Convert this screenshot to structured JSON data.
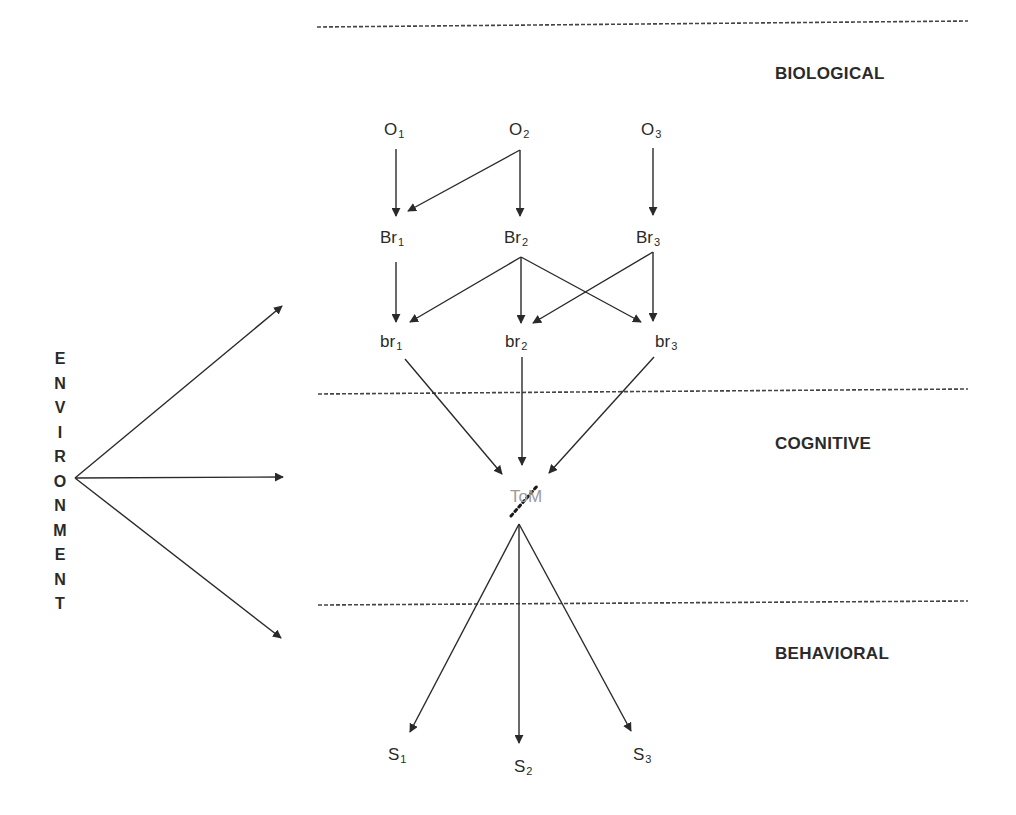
{
  "levels": {
    "biological": "BIOLOGICAL",
    "cognitive": "COGNITIVE",
    "behavioral": "BEHAVIORAL"
  },
  "environment": {
    "label": "ENVIRONMENT",
    "letters": [
      "E",
      "N",
      "V",
      "I",
      "R",
      "O",
      "N",
      "M",
      "E",
      "N",
      "T"
    ]
  },
  "nodes": {
    "O1": {
      "base": "O",
      "sub": "1"
    },
    "O2": {
      "base": "O",
      "sub": "2"
    },
    "O3": {
      "base": "O",
      "sub": "3"
    },
    "Br1": {
      "base": "Br",
      "sub": "1"
    },
    "Br2": {
      "base": "Br",
      "sub": "2"
    },
    "Br3": {
      "base": "Br",
      "sub": "3"
    },
    "br1": {
      "base": "br",
      "sub": "1"
    },
    "br2": {
      "base": "br",
      "sub": "2"
    },
    "br3": {
      "base": "br",
      "sub": "3"
    },
    "ToM": {
      "label": "ToM",
      "color": "#9a9a9a"
    },
    "S1": {
      "base": "S",
      "sub": "1"
    },
    "S2": {
      "base": "S",
      "sub": "2"
    },
    "S3": {
      "base": "S",
      "sub": "3"
    }
  },
  "edges": [
    [
      "O1",
      "Br1"
    ],
    [
      "O2",
      "Br1"
    ],
    [
      "O2",
      "Br2"
    ],
    [
      "O3",
      "Br3"
    ],
    [
      "Br1",
      "br1"
    ],
    [
      "Br2",
      "br1"
    ],
    [
      "Br2",
      "br2"
    ],
    [
      "Br2",
      "br3"
    ],
    [
      "Br3",
      "br2"
    ],
    [
      "Br3",
      "br3"
    ],
    [
      "br1",
      "ToM"
    ],
    [
      "br2",
      "ToM"
    ],
    [
      "br3",
      "ToM"
    ],
    [
      "ToM",
      "S1"
    ],
    [
      "ToM",
      "S2"
    ],
    [
      "ToM",
      "S3"
    ],
    [
      "Environment",
      "Biological"
    ],
    [
      "Environment",
      "Cognitive"
    ],
    [
      "Environment",
      "Behavioral"
    ]
  ],
  "colors": {
    "line": "#2a2a2a",
    "divider": "#444444",
    "tom_text": "#9a9a9a"
  }
}
